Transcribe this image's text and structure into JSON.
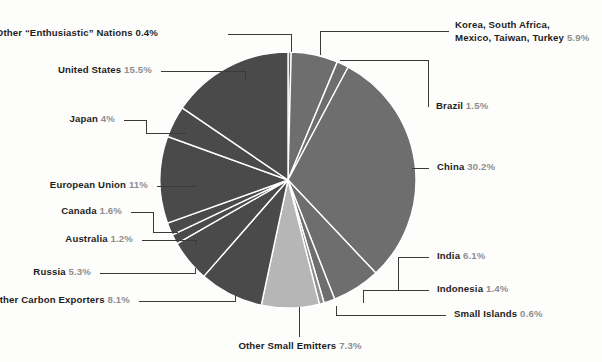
{
  "chart_data": {
    "type": "pie",
    "title": "",
    "center": {
      "x": 288,
      "y": 180
    },
    "radius": 128,
    "start_angle_deg": 0,
    "direction": "clockwise",
    "legend": "none",
    "grid": false,
    "labels_style": "external leader lines",
    "categories": [
      "Other \"Enthusiastic\" Nations",
      "Korea, South Africa, Mexico, Taiwan, Turkey",
      "Brazil",
      "China",
      "India",
      "Indonesia",
      "Small Islands",
      "Other Small Emitters",
      "Other Carbon Exporters",
      "Russia",
      "Australia",
      "Canada",
      "European Union",
      "Japan",
      "United States"
    ],
    "values": [
      0.4,
      5.9,
      1.5,
      30.2,
      6.1,
      1.4,
      0.6,
      7.3,
      8.1,
      5.3,
      1.2,
      1.6,
      11.0,
      4.0,
      15.5
    ],
    "unit": "%",
    "colors": [
      "#6e6e6e",
      "#6e6e6e",
      "#6e6e6e",
      "#6e6e6e",
      "#6e6e6e",
      "#6e6e6e",
      "#8f8f8f",
      "#b6b6b6",
      "#4a4a4a",
      "#4a4a4a",
      "#4a4a4a",
      "#4a4a4a",
      "#4a4a4a",
      "#4a4a4a",
      "#4a4a4a"
    ]
  },
  "labels": {
    "enthusiastic": {
      "name": "Other “Enthusiastic” Nations",
      "pct": "0.4%"
    },
    "united_states": {
      "name": "United States",
      "pct": "15.5%"
    },
    "japan": {
      "name": "Japan",
      "pct": "4%"
    },
    "european_union": {
      "name": "European Union",
      "pct": "11%"
    },
    "canada": {
      "name": "Canada",
      "pct": "1.6%"
    },
    "australia": {
      "name": "Australia",
      "pct": "1.2%"
    },
    "russia": {
      "name": "Russia",
      "pct": "5.3%"
    },
    "other_carbon_exporters": {
      "name": "Other Carbon Exporters",
      "pct": "8.1%"
    },
    "other_small_emitters": {
      "name": "Other Small Emitters",
      "pct": "7.3%"
    },
    "korea_group": {
      "line1": "Korea, South Africa,",
      "line2": "Mexico, Taiwan, Turkey",
      "pct": "5.9%"
    },
    "brazil": {
      "name": "Brazil",
      "pct": "1.5%"
    },
    "china": {
      "name": "China",
      "pct": "30.2%"
    },
    "india": {
      "name": "India",
      "pct": "6.1%"
    },
    "indonesia": {
      "name": "Indonesia",
      "pct": "1.4%"
    },
    "small_islands": {
      "name": "Small Islands",
      "pct": "0.6%"
    }
  },
  "colors": {
    "background": "#fdfdfc",
    "slice_dark": "#4a4a4a",
    "slice_mid": "#6e6e6e",
    "slice_light": "#b6b6b6",
    "separator": "#ffffff",
    "label_text": "#1d1d1d",
    "label_pct": "#8e8e8e",
    "leader_line": "#3a3a3a"
  }
}
